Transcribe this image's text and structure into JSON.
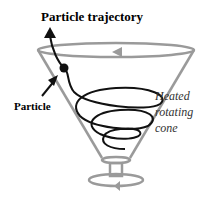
{
  "diagram": {
    "title_label": "Particle trajectory",
    "particle_label": "Particle",
    "cone_label_lines": [
      "Heated",
      "rotating",
      "cone"
    ],
    "colors": {
      "cone": "#9a9a9a",
      "trajectory": "#111111",
      "text": "#000000"
    }
  }
}
